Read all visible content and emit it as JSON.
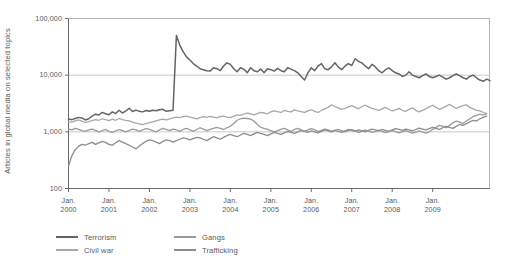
{
  "chart_data": {
    "type": "line",
    "title": "",
    "subtitle": "",
    "xlabel": "",
    "ylabel": "Articles in global media on selected topics",
    "yscale": "log",
    "ylim": [
      100,
      100000
    ],
    "ytick_labels": [
      "100,000",
      "10,000",
      "1,000",
      "100"
    ],
    "ytick_values": [
      100000,
      10000,
      1000,
      100
    ],
    "grid": "horizontal-gridlines-at-10000-and-1000",
    "legend_position": "below-plot-left",
    "xlim": [
      "2000-01",
      "2009-12"
    ],
    "xtick_labels": [
      [
        "Jan.",
        "2000"
      ],
      [
        "Jan.",
        "2001"
      ],
      [
        "Jan.",
        "2002"
      ],
      [
        "Jan.",
        "2003"
      ],
      [
        "Jan.",
        "2004"
      ],
      [
        "Jan.",
        "2005"
      ],
      [
        "Jan.",
        "2006"
      ],
      [
        "Jan.",
        "2007"
      ],
      [
        "Jan.",
        "2008"
      ],
      [
        "Jan.",
        "2009"
      ]
    ],
    "xtick_values": [
      2000,
      2001,
      2002,
      2003,
      2004,
      2005,
      2006,
      2007,
      2008,
      2009
    ],
    "x_start": 2000.0,
    "x_step_months": 1,
    "series": [
      {
        "name": "Terrorism",
        "color": "#646464",
        "values": [
          1680,
          1640,
          1720,
          1800,
          1760,
          1620,
          1700,
          1900,
          2050,
          1980,
          2200,
          2080,
          2000,
          2250,
          2100,
          2400,
          2150,
          2350,
          2600,
          2280,
          2420,
          2300,
          2250,
          2380,
          2300,
          2400,
          2350,
          2450,
          2500,
          2300,
          2350,
          2400,
          50000,
          34000,
          26000,
          21000,
          18500,
          16000,
          14500,
          13000,
          12500,
          12000,
          11800,
          13500,
          13000,
          12000,
          14500,
          16500,
          15500,
          13000,
          11500,
          13500,
          12800,
          11000,
          13500,
          12000,
          11500,
          12800,
          11000,
          13000,
          12500,
          11800,
          13200,
          12000,
          11500,
          13500,
          12800,
          12000,
          11000,
          9500,
          8200,
          11000,
          13500,
          12000,
          14500,
          16000,
          13000,
          12500,
          14000,
          16500,
          14000,
          12500,
          14500,
          16000,
          14800,
          19500,
          17500,
          16500,
          14500,
          13000,
          15500,
          14000,
          12000,
          11000,
          12500,
          13500,
          12000,
          11000,
          10500,
          9500,
          10000,
          11500,
          10000,
          9500,
          9000,
          9800,
          10500,
          9500,
          9000,
          9500,
          10000,
          9200,
          8500,
          9000,
          9800,
          10500,
          9800,
          9000,
          8500,
          9500,
          10000,
          9000,
          8200,
          7800,
          8500,
          8000
        ]
      },
      {
        "name": "Civil war",
        "color": "#a8a8a8",
        "values": [
          1500,
          1480,
          1560,
          1620,
          1550,
          1460,
          1520,
          1580,
          1640,
          1600,
          1700,
          1650,
          1580,
          1680,
          1600,
          1720,
          1650,
          1600,
          1560,
          1480,
          1420,
          1380,
          1340,
          1400,
          1450,
          1500,
          1560,
          1620,
          1680,
          1620,
          1700,
          1760,
          1820,
          1780,
          1850,
          1900,
          1820,
          1760,
          1700,
          1780,
          1850,
          1800,
          1880,
          1820,
          1760,
          1850,
          1900,
          1820,
          1780,
          1900,
          2000,
          1950,
          2050,
          2150,
          2080,
          2000,
          2100,
          2200,
          2150,
          2080,
          2250,
          2350,
          2280,
          2200,
          2400,
          2300,
          2250,
          2450,
          2350,
          2280,
          2200,
          2350,
          2450,
          2300,
          2200,
          2400,
          2550,
          2700,
          3000,
          2800,
          2650,
          2500,
          2600,
          2750,
          2900,
          2700,
          2550,
          2800,
          2950,
          2750,
          2600,
          2500,
          2400,
          2550,
          2700,
          2500,
          2350,
          2450,
          2600,
          2400,
          2300,
          2500,
          2650,
          2400,
          2250,
          2400,
          2550,
          2750,
          2950,
          2700,
          2500,
          2650,
          2850,
          3050,
          2800,
          2600,
          2750,
          2900,
          3000,
          2700,
          2550,
          2400,
          2350,
          2200,
          2100
        ]
      },
      {
        "name": "Gangs",
        "color": "#9a9a9a",
        "values": [
          1120,
          1080,
          1150,
          1100,
          1050,
          1020,
          1080,
          1120,
          1060,
          1000,
          1050,
          1100,
          1020,
          980,
          1040,
          1100,
          1050,
          1000,
          1060,
          1120,
          1080,
          1020,
          1080,
          1140,
          1100,
          1050,
          1000,
          1080,
          1150,
          1100,
          1050,
          1120,
          1080,
          1020,
          1100,
          1150,
          1080,
          1020,
          1100,
          1180,
          1120,
          1050,
          1100,
          1150,
          1200,
          1150,
          1100,
          1180,
          1250,
          1400,
          1600,
          1700,
          1750,
          1720,
          1680,
          1550,
          1350,
          1200,
          1150,
          1100,
          1050,
          1000,
          1050,
          1100,
          1150,
          1080,
          1020,
          1100,
          1150,
          1080,
          1020,
          1080,
          1140,
          1080,
          1020,
          1060,
          1120,
          1080,
          1020,
          1060,
          1100,
          1050,
          1000,
          1050,
          1100,
          1040,
          980,
          1020,
          1080,
          1030,
          980,
          1020,
          1070,
          1020,
          970,
          1010,
          1060,
          1010,
          960,
          1000,
          1050,
          1000,
          950,
          990,
          1040,
          990,
          950,
          1000,
          1100,
          1200,
          1300,
          1250,
          1180,
          1300,
          1450,
          1550,
          1480,
          1400,
          1550,
          1700,
          1850,
          1950,
          2050,
          1980,
          2100
        ]
      },
      {
        "name": "Trafficking",
        "color": "#8c8c8c",
        "values": [
          250,
          380,
          480,
          560,
          600,
          580,
          620,
          650,
          600,
          640,
          680,
          650,
          600,
          580,
          640,
          700,
          660,
          620,
          580,
          540,
          500,
          560,
          620,
          680,
          720,
          700,
          660,
          620,
          680,
          720,
          700,
          660,
          700,
          740,
          780,
          760,
          720,
          760,
          800,
          780,
          740,
          700,
          760,
          820,
          780,
          740,
          800,
          860,
          900,
          860,
          820,
          880,
          940,
          900,
          860,
          920,
          980,
          940,
          900,
          860,
          920,
          980,
          940,
          900,
          960,
          1020,
          980,
          940,
          1000,
          1060,
          1020,
          980,
          1040,
          1000,
          960,
          1020,
          1080,
          1040,
          1000,
          1060,
          1020,
          980,
          1040,
          1100,
          1060,
          1020,
          1080,
          1040,
          1000,
          1060,
          1120,
          1080,
          1040,
          1100,
          1060,
          1020,
          1080,
          1140,
          1100,
          1060,
          1120,
          1080,
          1040,
          1100,
          1160,
          1120,
          1080,
          1140,
          1200,
          1150,
          1100,
          1180,
          1250,
          1200,
          1150,
          1250,
          1350,
          1300,
          1400,
          1500,
          1600,
          1550,
          1700,
          1800,
          1900
        ]
      }
    ]
  },
  "axes": {
    "y_title": "Articles in global media on selected topics"
  },
  "legend": {
    "items": [
      {
        "label": "Terrorism",
        "color": "#646464"
      },
      {
        "label": "Civil war",
        "color": "#a8a8a8"
      },
      {
        "label": "Gangs",
        "color": "#9a9a9a"
      },
      {
        "label": "Trafficking",
        "color": "#8c8c8c"
      }
    ]
  }
}
